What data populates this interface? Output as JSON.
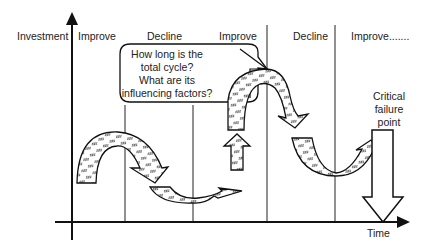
{
  "diagram": {
    "y_axis_label": "Investment",
    "x_axis_label": "Time",
    "phases": [
      {
        "label": "Improve"
      },
      {
        "label": "Decline"
      },
      {
        "label": "Improve"
      },
      {
        "label": "Decline"
      },
      {
        "label": "Improve......."
      }
    ],
    "callout": {
      "line1": "How long is the",
      "line2": "total cycle?",
      "line3": "What are its",
      "line4": "influencing factors?"
    },
    "critical_point": {
      "line1": "Critical",
      "line2": "failure",
      "line3": "point"
    },
    "colors": {
      "stroke": "#111111",
      "fill": "#ffffff",
      "text": "#222222"
    }
  }
}
